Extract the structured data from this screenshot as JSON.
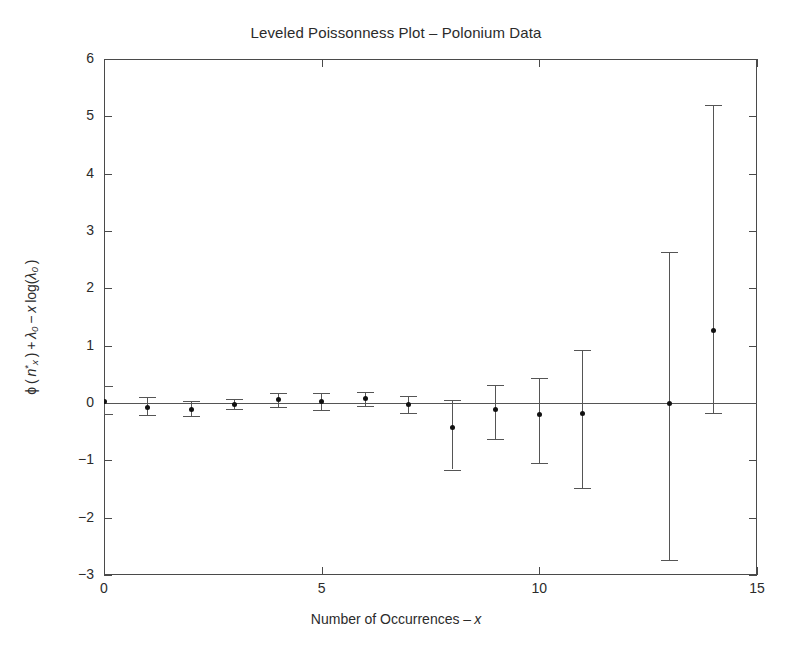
{
  "chart_data": {
    "type": "scatter",
    "title": "Leveled Poissonness Plot – Polonium Data",
    "xlabel": "Number of Occurrences – x",
    "ylabel": "φ(n*x) + λ0 − x log(λ0)",
    "xlim": [
      0,
      15
    ],
    "ylim": [
      -3,
      6
    ],
    "xticks": [
      0,
      5,
      10,
      15
    ],
    "yticks": [
      -3,
      -2,
      -1,
      0,
      1,
      2,
      3,
      4,
      5,
      6
    ],
    "grid": false,
    "legend": "none",
    "reference_line_y": 0,
    "marker": "filled-circle",
    "errorbar_style": "capped",
    "x": [
      0,
      1,
      2,
      3,
      4,
      5,
      6,
      7,
      8,
      9,
      10,
      11,
      13,
      14
    ],
    "y": [
      0.03,
      -0.07,
      -0.11,
      -0.02,
      0.06,
      0.03,
      0.08,
      -0.02,
      -0.42,
      -0.11,
      -0.2,
      -0.19,
      -0.01,
      1.26
    ],
    "y_err_low": [
      -0.2,
      -0.21,
      -0.23,
      -0.11,
      -0.07,
      -0.12,
      -0.06,
      -0.18,
      -1.16,
      -0.62,
      -1.04,
      -1.49,
      -2.74,
      -0.18
    ],
    "y_err_high": [
      0.3,
      0.1,
      0.04,
      0.07,
      0.18,
      0.17,
      0.2,
      0.12,
      0.05,
      0.32,
      0.43,
      0.93,
      2.64,
      5.2
    ],
    "axis_color": "#4a4a4a",
    "marker_color": "#111111",
    "errorbar_color": "#555555"
  },
  "axis_labels": {
    "x": [
      "0",
      "5",
      "10",
      "15"
    ],
    "y": [
      "6",
      "5",
      "4",
      "3",
      "2",
      "1",
      "0",
      "−1",
      "−2",
      "−3"
    ]
  }
}
